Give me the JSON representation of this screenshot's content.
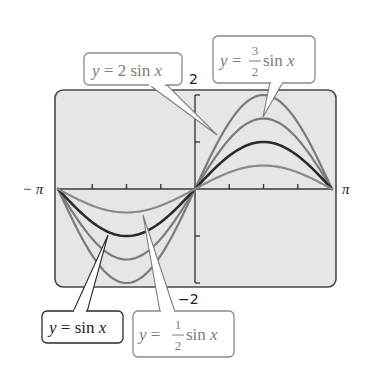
{
  "chart_data": {
    "type": "line",
    "title": "",
    "xlabel": "",
    "ylabel": "",
    "xlim": [
      "-π",
      "π"
    ],
    "ylim": [
      -2,
      2
    ],
    "x_tick_labels": [
      "−π",
      "π"
    ],
    "y_tick_labels": [
      "2",
      "−2"
    ],
    "x_ticks_count_each_side": 3,
    "y_ticks": [
      -2,
      -1,
      1,
      2
    ],
    "grid": false,
    "legend": "callout labels",
    "series": [
      {
        "name": "y = 2 sin x",
        "amplitude": 2,
        "color": "#7a7a7a",
        "width": 2.2,
        "label": {
          "prefix": "y = ",
          "coef": "2",
          "suffix": " sin x",
          "fraction": false
        }
      },
      {
        "name": "y = 3/2 sin x",
        "amplitude": 1.5,
        "color": "#7a7a7a",
        "width": 2.2,
        "label": {
          "prefix": "y = ",
          "num": "3",
          "den": "2",
          "suffix": " sin x",
          "fraction": true
        }
      },
      {
        "name": "y = sin x",
        "amplitude": 1,
        "color": "#2a2a2a",
        "width": 2.6,
        "label": {
          "prefix": "y = ",
          "coef": "",
          "suffix": "sin x",
          "fraction": false
        }
      },
      {
        "name": "y = 1/2 sin x",
        "amplitude": 0.5,
        "color": "#8a8a8a",
        "width": 2.2,
        "label": {
          "prefix": "y = ",
          "num": "1",
          "den": "2",
          "suffix": " sin x",
          "fraction": true
        }
      }
    ]
  },
  "labels": {
    "neg_pi": "− π",
    "pos_pi": "π",
    "y_max": "2",
    "y_min": "−2",
    "eq_2": {
      "y": "y",
      "eq": " = 2 sin ",
      "x": "x"
    },
    "eq_3_2": {
      "y": "y",
      "eq": " = ",
      "num": "3",
      "den": "2",
      "sin": " sin ",
      "x": "x"
    },
    "eq_1": {
      "y": "y",
      "eq": " = sin ",
      "x": "x"
    },
    "eq_1_2": {
      "y": "y",
      "eq": " = ",
      "num": "1",
      "den": "2",
      "sin": " sin ",
      "x": "x"
    }
  },
  "colors": {
    "plot_background": "#e6e6e6",
    "frame": "#4a4a4a",
    "axis": "#3a3a3a",
    "label_gray": "#7d7d7d",
    "label_dark": "#222222"
  }
}
